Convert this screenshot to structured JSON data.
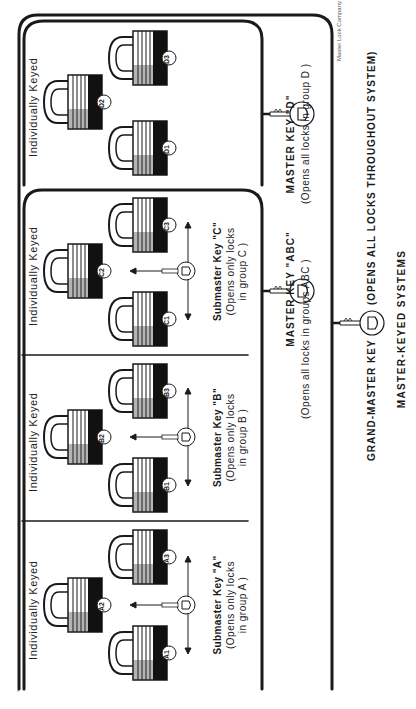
{
  "title": "MASTER-KEYED SYSTEMS",
  "credit": "Master Lock Company",
  "colors": {
    "ink": "#1a1a1a",
    "paper": "#ffffff"
  },
  "grand_master": {
    "label": "GRAND-MASTER KEY",
    "description": "(OPENS ALL LOCKS THROUGHOUT SYSTEM)",
    "icon": "key-icon"
  },
  "master_keys": [
    {
      "id": "ABC",
      "label": "MASTER KEY \"ABC\"",
      "description": "(Opens all locks in groups  ABC )",
      "icon": "key-icon"
    },
    {
      "id": "D",
      "label": "MASTER KEY \"D\"",
      "description": "(Opens all locks in group  D )",
      "icon": "key-icon"
    }
  ],
  "groups": [
    {
      "id": "A",
      "heading": "Individually Keyed",
      "locks": [
        "A1",
        "A2",
        "A3"
      ],
      "submaster": {
        "label": "Submaster Key \"A\"",
        "desc_line1": "(Opens only locks",
        "desc_line2": "in group  A )"
      }
    },
    {
      "id": "B",
      "heading": "Individually Keyed",
      "locks": [
        "B1",
        "B2",
        "B3"
      ],
      "submaster": {
        "label": "Submaster Key \"B\"",
        "desc_line1": "(Opens only locks",
        "desc_line2": "in group  B )"
      }
    },
    {
      "id": "C",
      "heading": "Individually Keyed",
      "locks": [
        "C1",
        "C2",
        "C3"
      ],
      "submaster": {
        "label": "Submaster Key \"C\"",
        "desc_line1": "(Opens only locks",
        "desc_line2": "in group  C )"
      }
    },
    {
      "id": "D",
      "heading": "Individually Keyed",
      "locks": [
        "D1",
        "D2",
        "D3"
      ]
    }
  ]
}
